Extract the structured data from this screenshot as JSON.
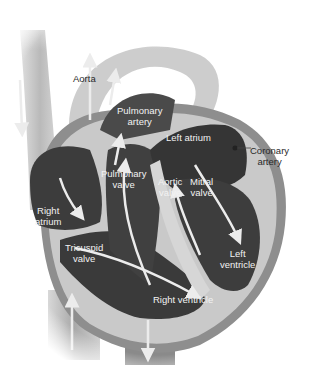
{
  "diagram": {
    "style": "grayscale cutaway illustration",
    "labels": {
      "aorta": "Aorta",
      "pulmonary_artery_1": "Pulmonary",
      "pulmonary_artery_2": "artery",
      "left_atrium": "Left atrium",
      "coronary_artery_1": "Coronary",
      "coronary_artery_2": "artery",
      "pulmonary_valve_1": "Pulmonary",
      "pulmonary_valve_2": "valve",
      "aortic_valve_1": "Aortic",
      "aortic_valve_2": "valve",
      "mitral_valve_1": "Mitral",
      "mitral_valve_2": "valve",
      "right_atrium_1": "Right",
      "right_atrium_2": "atrium",
      "tricuspid_valve_1": "Tricuspid",
      "tricuspid_valve_2": "valve",
      "left_ventricle_1": "Left",
      "left_ventricle_2": "ventricle",
      "right_ventricle": "Right ventricle"
    },
    "colors": {
      "chamber": "#3c3c3c",
      "wall": "#9a9a9a",
      "wall_light": "#c8c8c8",
      "septum": "#d6d6d6",
      "vessel": "#b5b5b5",
      "arrow": "#e8e8e8",
      "background": "#ffffff"
    }
  }
}
